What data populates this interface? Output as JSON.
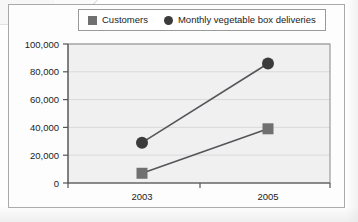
{
  "figure": {
    "frame_color": "#a9a9a9",
    "plot_background": "#f0f0f0",
    "gridline_color": "#d9d9d9"
  },
  "legend": {
    "position": "top-center",
    "boxed": true,
    "entries": [
      {
        "label": "Customers",
        "marker": "square",
        "color": "#707070"
      },
      {
        "label": "Monthly vegetable box deliveries",
        "marker": "circle",
        "color": "#3b3b3b"
      }
    ]
  },
  "chart_data": {
    "type": "line",
    "title": "",
    "xlabel": "",
    "ylabel": "",
    "categories": [
      "2003",
      "2005"
    ],
    "x_tick_labels": [
      "2003",
      "2005"
    ],
    "y_tick_labels": [
      "0",
      "20,000",
      "40,000",
      "60,000",
      "80,000",
      "100,000"
    ],
    "y_ticks": [
      0,
      20000,
      40000,
      60000,
      80000,
      100000
    ],
    "ylim": [
      0,
      100000
    ],
    "grid": true,
    "legend_position": "top-center",
    "series": [
      {
        "name": "Customers",
        "marker": "square",
        "color": "#707070",
        "values": [
          7000,
          39000
        ]
      },
      {
        "name": "Monthly vegetable box deliveries",
        "marker": "circle",
        "color": "#3b3b3b",
        "values": [
          29000,
          86000
        ]
      }
    ]
  }
}
